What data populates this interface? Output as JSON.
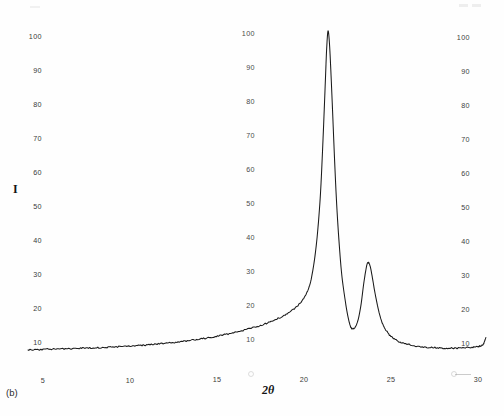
{
  "figure": {
    "panel_caption": "(b)",
    "y_axis_title": "I",
    "x_axis_title": "2θ"
  },
  "chart_data": {
    "type": "line",
    "title": "",
    "subtitle": "",
    "xlabel": "2θ",
    "ylabel": "I",
    "xlim": [
      4.0,
      30.6
    ],
    "ylim": [
      0,
      107
    ],
    "grid": false,
    "legend": null,
    "x_ticks": [
      5,
      10,
      15,
      20,
      25,
      30
    ],
    "y_ticks": [
      10,
      20,
      30,
      40,
      50,
      60,
      70,
      80,
      90,
      100
    ],
    "x_tick_labels": [
      "5",
      "10",
      "15",
      "20",
      "25",
      "30"
    ],
    "y_tick_labels": [
      "10",
      "20",
      "30",
      "40",
      "50",
      "60",
      "70",
      "80",
      "90",
      "100"
    ],
    "annotations": [
      "(b)"
    ],
    "peaks": [
      {
        "name": "main-peak",
        "x": 21.4,
        "y": 102
      },
      {
        "name": "secondary-peak",
        "x": 23.7,
        "y": 33
      }
    ],
    "valleys": [
      {
        "name": "inter-peak-valley",
        "x": 22.7,
        "y": 14
      }
    ],
    "series": [
      {
        "name": "diffractogram",
        "color": "#1a1a1a",
        "x": [
          4.2,
          4.6,
          5.0,
          5.4,
          5.8,
          6.2,
          6.6,
          7.0,
          7.4,
          7.8,
          8.2,
          8.6,
          9.0,
          9.4,
          9.8,
          10.2,
          10.6,
          11.0,
          11.4,
          11.8,
          12.2,
          12.6,
          13.0,
          13.4,
          13.8,
          14.2,
          14.6,
          15.0,
          15.4,
          15.8,
          16.2,
          16.6,
          17.0,
          17.4,
          17.8,
          18.2,
          18.6,
          19.0,
          19.4,
          19.8,
          20.1,
          20.35,
          20.5,
          20.65,
          20.8,
          20.95,
          21.05,
          21.15,
          21.25,
          21.32,
          21.4,
          21.48,
          21.56,
          21.66,
          21.78,
          21.9,
          22.05,
          22.2,
          22.4,
          22.55,
          22.7,
          22.85,
          23.0,
          23.15,
          23.3,
          23.45,
          23.6,
          23.7,
          23.82,
          23.95,
          24.1,
          24.3,
          24.5,
          24.75,
          25.0,
          25.3,
          25.6,
          26.0,
          26.4,
          26.8,
          27.2,
          27.6,
          28.0,
          28.4,
          28.8,
          29.2,
          29.6,
          29.9,
          30.1,
          30.25,
          30.35,
          30.45
        ],
        "y": [
          7.4,
          7.5,
          7.5,
          7.6,
          7.6,
          7.7,
          7.7,
          7.8,
          7.9,
          7.9,
          8.0,
          8.1,
          8.2,
          8.3,
          8.4,
          8.5,
          8.7,
          8.8,
          9.0,
          9.2,
          9.4,
          9.6,
          9.9,
          10.1,
          10.4,
          10.7,
          11.0,
          11.4,
          11.8,
          12.2,
          12.7,
          13.2,
          13.8,
          14.4,
          15.1,
          15.9,
          16.8,
          17.9,
          19.3,
          21.2,
          23.5,
          26.5,
          30.0,
          35.0,
          42.0,
          52.0,
          62.0,
          74.0,
          87.0,
          96.0,
          101.5,
          98.0,
          90.0,
          78.0,
          63.0,
          50.0,
          38.0,
          29.0,
          21.5,
          17.0,
          14.2,
          13.6,
          14.4,
          16.8,
          21.0,
          27.0,
          31.8,
          33.2,
          32.0,
          28.5,
          24.0,
          19.0,
          15.5,
          13.0,
          11.4,
          10.3,
          9.6,
          9.0,
          8.6,
          8.3,
          8.1,
          8.0,
          7.9,
          7.9,
          7.9,
          8.0,
          8.1,
          8.3,
          8.5,
          8.8,
          9.6,
          11.0
        ]
      }
    ]
  }
}
